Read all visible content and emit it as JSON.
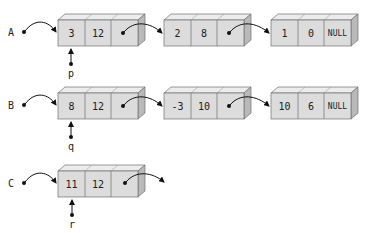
{
  "colors": {
    "front": "#dcdcdc",
    "top": "#ececec",
    "side": "#b9b9b9",
    "stroke": "#707070",
    "ink": "#111111"
  },
  "lists": [
    {
      "name": "A",
      "pointer": "p",
      "nodes": [
        {
          "data": "3",
          "count": "12"
        },
        {
          "data": "2",
          "count": "8"
        },
        {
          "data": "1",
          "count": "0",
          "next": "NULL"
        }
      ]
    },
    {
      "name": "B",
      "pointer": "q",
      "nodes": [
        {
          "data": "8",
          "count": "12"
        },
        {
          "data": "-3",
          "count": "10"
        },
        {
          "data": "10",
          "count": "6",
          "next": "NULL"
        }
      ]
    },
    {
      "name": "C",
      "pointer": "r",
      "nodes": [
        {
          "data": "11",
          "count": "12"
        }
      ]
    }
  ]
}
